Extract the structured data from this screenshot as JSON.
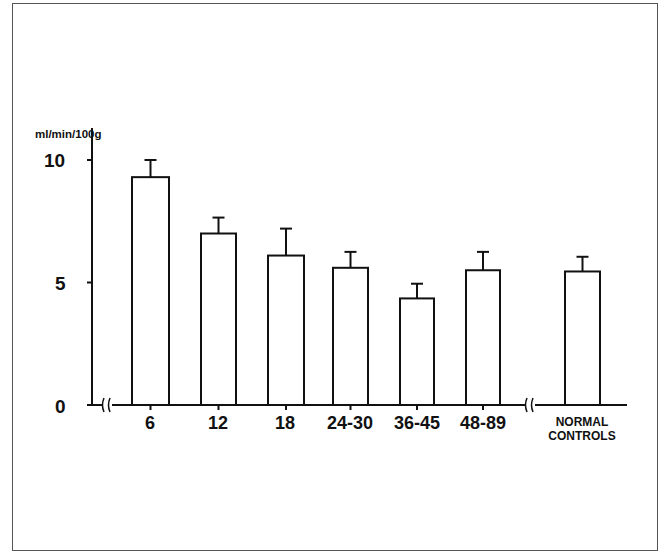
{
  "chart_data": {
    "type": "bar",
    "title": "",
    "xlabel": "",
    "ylabel": "ml/min/100g",
    "ylim": [
      0,
      10.5
    ],
    "yticks": [
      0,
      5,
      10
    ],
    "ytick_labels": [
      "0",
      "5",
      "10"
    ],
    "categories": [
      "6",
      "12",
      "18",
      "24-30",
      "36-45",
      "48-89",
      "NORMAL CONTROLS"
    ],
    "values": [
      9.3,
      7.0,
      6.1,
      5.6,
      4.35,
      5.5,
      5.45
    ],
    "error_upper": [
      10.0,
      7.65,
      7.2,
      6.25,
      4.95,
      6.25,
      6.05
    ],
    "error_bars": true,
    "grid": false,
    "legend": null,
    "axis_breaks": [
      "x-axis between origin and 6",
      "x-axis between 48-89 and NORMAL CONTROLS"
    ]
  },
  "labels": {
    "ylabel": "ml/min/100g",
    "y0": "0",
    "y5": "5",
    "y10": "10",
    "x": [
      "6",
      "12",
      "18",
      "24-30",
      "36-45",
      "48-89"
    ],
    "normal_line1": "NORMAL",
    "normal_line2": "CONTROLS"
  }
}
